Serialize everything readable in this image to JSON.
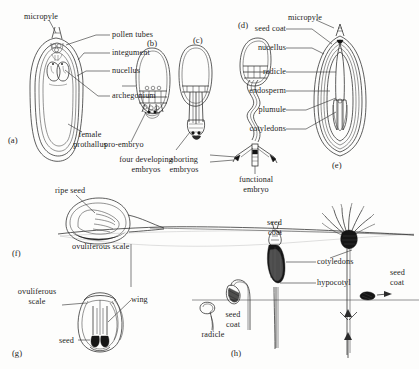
{
  "figure": {
    "background_color": "#fdfdfc",
    "ink_color": "#2a2a2a",
    "panels": [
      {
        "id": "a",
        "label": "(a)",
        "caption": "Longitudinal section of ovule showing pollen tubes, archegonia and female prothallus"
      },
      {
        "id": "b",
        "label": "(b)",
        "caption": "Ovule with pro-embryo and four developing embryos"
      },
      {
        "id": "c",
        "label": "(c)",
        "caption": "Ovule with aborting embryos"
      },
      {
        "id": "d",
        "label": "(d)",
        "caption": "Elongated suspensor with functional embryo"
      },
      {
        "id": "e",
        "label": "(e)",
        "caption": "Mature seed in longitudinal section"
      },
      {
        "id": "f",
        "label": "(f)",
        "caption": "Ripe seed on ovuliferous scale, side view"
      },
      {
        "id": "g",
        "label": "(g)",
        "caption": "Winged seed on ovuliferous scale, face view"
      },
      {
        "id": "h",
        "label": "(h)",
        "caption": "Germination sequence of the seed into a seedling"
      }
    ],
    "labels": [
      {
        "name": "micropyle-a",
        "text": "micropyle",
        "panel": "a"
      },
      {
        "name": "pollen-tubes",
        "text": "pollen tubes",
        "panel": "a"
      },
      {
        "name": "integument",
        "text": "integument",
        "panel": "a"
      },
      {
        "name": "nucellus-a",
        "text": "nucellus",
        "panel": "a"
      },
      {
        "name": "archegonium",
        "text": "archegonium",
        "panel": "a"
      },
      {
        "name": "female-prothallus",
        "text": "female\nprothallus",
        "panel": "a"
      },
      {
        "name": "pro-embryo",
        "text": "pro-embryo",
        "panel": "b"
      },
      {
        "name": "four-developing-embryos",
        "text": "four developing\nembryos",
        "panel": "b"
      },
      {
        "name": "aborting-embryos",
        "text": "aborting\nembryos",
        "panel": "c"
      },
      {
        "name": "functional-embryo",
        "text": "functional\nembryo",
        "panel": "d"
      },
      {
        "name": "seed-coat-e",
        "text": "seed coat",
        "panel": "e"
      },
      {
        "name": "micropyle-e",
        "text": "micropyle",
        "panel": "e"
      },
      {
        "name": "nucellus-e",
        "text": "nucellus",
        "panel": "e"
      },
      {
        "name": "radicle-e",
        "text": "radicle",
        "panel": "e"
      },
      {
        "name": "endosperm",
        "text": "endosperm",
        "panel": "e"
      },
      {
        "name": "plumule",
        "text": "plumule",
        "panel": "e"
      },
      {
        "name": "cotyledons-e",
        "text": "cotyledons",
        "panel": "e"
      },
      {
        "name": "ripe-seed",
        "text": "ripe seed",
        "panel": "f"
      },
      {
        "name": "ovuliferous-scale-f",
        "text": "ovuliferous scale",
        "panel": "f"
      },
      {
        "name": "ovuliferous-scale-g",
        "text": "ovuliferous\nscale",
        "panel": "g"
      },
      {
        "name": "wing",
        "text": "wing",
        "panel": "g"
      },
      {
        "name": "seed-g",
        "text": "seed",
        "panel": "g"
      },
      {
        "name": "radicle-h",
        "text": "radicle",
        "panel": "h"
      },
      {
        "name": "seed-coat-h1",
        "text": "seed\ncoat",
        "panel": "h"
      },
      {
        "name": "seed-coat-h2",
        "text": "seed\ncoat",
        "panel": "h"
      },
      {
        "name": "cotyledons-h",
        "text": "cotyledons",
        "panel": "h"
      },
      {
        "name": "hypocotyl",
        "text": "hypocotyl",
        "panel": "h"
      },
      {
        "name": "seed-coat-h3",
        "text": "seed\ncoat",
        "panel": "h"
      }
    ]
  },
  "panel_a": {
    "id": "(a)",
    "micropyle": "micropyle",
    "pollen_tubes": "pollen tubes",
    "integument": "integument",
    "nucellus": "nucellus",
    "archegonium": "archegonium",
    "female_prothallus_l1": "female",
    "female_prothallus_l2": "prothallus"
  },
  "panel_b": {
    "id": "(b)",
    "pro_embryo": "pro-embryo",
    "four_l1": "four developing",
    "four_l2": "embryos"
  },
  "panel_c": {
    "id": "(c)",
    "aborting_l1": "aborting",
    "aborting_l2": "embryos"
  },
  "panel_d": {
    "id": "(d)",
    "functional_l1": "functional",
    "functional_l2": "embryo"
  },
  "panel_e": {
    "id": "(e)",
    "seed_coat": "seed coat",
    "micropyle": "micropyle",
    "nucellus": "nucellus",
    "radicle": "radicle",
    "endosperm": "endosperm",
    "plumule": "plumule",
    "cotyledons": "cotyledons"
  },
  "panel_f": {
    "id": "(f)",
    "ripe_seed": "ripe seed",
    "ovuliferous_scale": "ovuliferous scale"
  },
  "panel_g": {
    "id": "(g)",
    "ovuliferous_l1": "ovuliferous",
    "ovuliferous_l2": "scale",
    "wing": "wing",
    "seed": "seed"
  },
  "panel_h": {
    "id": "(h)",
    "radicle": "radicle",
    "seed_coat_1_l1": "seed",
    "seed_coat_1_l2": "coat",
    "seed_coat_2_l1": "seed",
    "seed_coat_2_l2": "coat",
    "cotyledons": "cotyledons",
    "hypocotyl": "hypocotyl",
    "seed_coat_3_l1": "seed",
    "seed_coat_3_l2": "coat"
  }
}
